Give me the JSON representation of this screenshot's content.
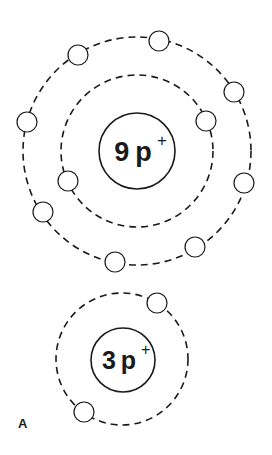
{
  "figure": {
    "label": "A",
    "atoms": [
      {
        "id": "fluorine",
        "nucleus": {
          "count": "9",
          "particle": "p",
          "charge": "+"
        },
        "shells": [
          {
            "electrons": 2
          },
          {
            "electrons": 7
          }
        ]
      },
      {
        "id": "lithium",
        "nucleus": {
          "count": "3",
          "particle": "p",
          "charge": "+"
        },
        "shells": [
          {
            "electrons": 2
          }
        ]
      }
    ]
  }
}
